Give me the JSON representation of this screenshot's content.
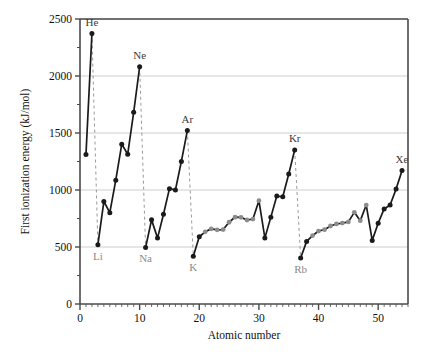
{
  "chart_data": {
    "type": "line",
    "title": "",
    "xlabel": "Atomic number",
    "ylabel": "First ionization energy (kJ/mol)",
    "xlim": [
      0,
      55
    ],
    "ylim": [
      0,
      2500
    ],
    "xticks": [
      0,
      10,
      20,
      30,
      40,
      50
    ],
    "xtick_labels": [
      "0",
      "10",
      "20",
      "30",
      "40",
      "50"
    ],
    "yticks": [
      0,
      500,
      1000,
      1500,
      2000,
      2500
    ],
    "ytick_labels": [
      "0",
      "500",
      "1000",
      "1500",
      "2000",
      "2500"
    ],
    "y_minor_ticks": [
      250,
      750,
      1250,
      1750,
      2250
    ],
    "grid": "horizontal-major",
    "legend": "none",
    "series": [
      {
        "name": "First ionization energy",
        "x": [
          1,
          2
        ],
        "values": [
          1312,
          2372
        ],
        "segment": "period1",
        "marker": "dark"
      },
      {
        "name": "First ionization energy",
        "x": [
          3,
          4,
          5,
          6,
          7,
          8,
          9,
          10
        ],
        "values": [
          520,
          899,
          801,
          1086,
          1402,
          1314,
          1681,
          2081
        ],
        "segment": "period2",
        "marker": "dark"
      },
      {
        "name": "First ionization energy",
        "x": [
          11,
          12,
          13,
          14,
          15,
          16,
          17,
          18
        ],
        "values": [
          496,
          738,
          578,
          787,
          1012,
          1000,
          1251,
          1521
        ],
        "segment": "period3",
        "marker": "dark"
      },
      {
        "name": "First ionization energy",
        "x": [
          19,
          20,
          21,
          22,
          23,
          24,
          25,
          26,
          27,
          28,
          29,
          30,
          31,
          32,
          33,
          34,
          35,
          36
        ],
        "values": [
          419,
          590,
          633,
          659,
          651,
          653,
          717,
          762,
          760,
          737,
          745,
          906,
          579,
          762,
          947,
          941,
          1140,
          1351
        ],
        "segment": "period4",
        "marker": "mixed"
      },
      {
        "name": "First ionization energy",
        "x": [
          37,
          38,
          39,
          40,
          41,
          42,
          43,
          44,
          45,
          46,
          47,
          48,
          49,
          50,
          51,
          52,
          53,
          54
        ],
        "values": [
          403,
          549,
          600,
          640,
          652,
          684,
          702,
          710,
          720,
          804,
          731,
          868,
          558,
          709,
          834,
          869,
          1008,
          1170
        ],
        "segment": "period5",
        "marker": "mixed"
      }
    ],
    "annotations": [
      {
        "label": "He",
        "x": 2,
        "value": 2372,
        "position": "above"
      },
      {
        "label": "Ne",
        "x": 10,
        "value": 2081,
        "position": "above"
      },
      {
        "label": "Ar",
        "x": 18,
        "value": 1521,
        "position": "above"
      },
      {
        "label": "Kr",
        "x": 36,
        "value": 1351,
        "position": "above"
      },
      {
        "label": "Xe",
        "x": 54,
        "value": 1170,
        "position": "above"
      },
      {
        "label": "Li",
        "x": 3,
        "value": 520,
        "position": "below"
      },
      {
        "label": "Na",
        "x": 11,
        "value": 496,
        "position": "below"
      },
      {
        "label": "K",
        "x": 19,
        "value": 419,
        "position": "below"
      },
      {
        "label": "Rb",
        "x": 37,
        "value": 403,
        "position": "below"
      }
    ],
    "dropline_pairs": [
      {
        "from_label": "He",
        "from_x": 2,
        "from_value": 2372,
        "to_label": "Li",
        "to_x": 3,
        "to_value": 520
      },
      {
        "from_label": "Ne",
        "from_x": 10,
        "from_value": 2081,
        "to_label": "Na",
        "to_x": 11,
        "to_value": 496
      },
      {
        "from_label": "Ar",
        "from_x": 18,
        "from_value": 1521,
        "to_label": "K",
        "to_x": 19,
        "to_value": 419
      },
      {
        "from_label": "Kr",
        "from_x": 36,
        "from_value": 1351,
        "to_label": "Rb",
        "to_x": 37,
        "to_value": 403
      }
    ],
    "colors": {
      "line": "#1a1a1a",
      "marker_dark": "#1a1a1a",
      "marker_light": "#8c8c8c",
      "dropline": "#9a9a9a",
      "grid": "#c8c8c8",
      "frame": "#4a4a4a",
      "text": "#111111",
      "label_gray": "#8a8a8a"
    }
  }
}
